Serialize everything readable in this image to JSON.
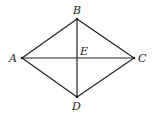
{
  "diagram": {
    "type": "rhombus-with-diagonals",
    "points": {
      "A": {
        "label": "A",
        "x": 22,
        "y": 58
      },
      "B": {
        "label": "B",
        "x": 77,
        "y": 19
      },
      "C": {
        "label": "C",
        "x": 134,
        "y": 58
      },
      "D": {
        "label": "D",
        "x": 77,
        "y": 97
      },
      "E": {
        "label": "E",
        "x": 77,
        "y": 58
      }
    },
    "segments": [
      "AB",
      "BC",
      "CD",
      "DA",
      "AC",
      "BD"
    ],
    "stroke_color": "#222222"
  }
}
